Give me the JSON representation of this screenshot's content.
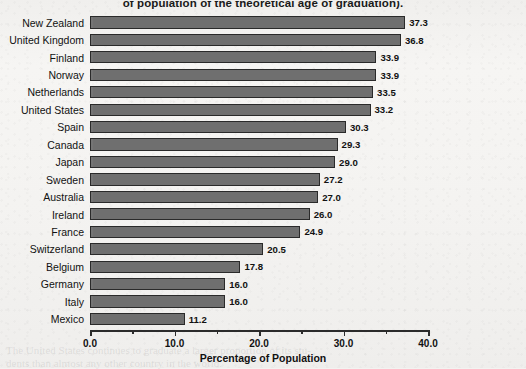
{
  "chart_data": {
    "type": "bar",
    "orientation": "horizontal",
    "title": "of population of the theoretical age of graduation).",
    "xlabel": "Percentage of Population",
    "ylabel": "",
    "xlim": [
      0.0,
      40.0
    ],
    "xticks": [
      "0.0",
      "10.0",
      "20.0",
      "30.0",
      "40.0"
    ],
    "xtick_values": [
      0,
      10,
      20,
      30,
      40
    ],
    "minor_tick_values": [
      5,
      15,
      25,
      35
    ],
    "grid": false,
    "legend": "none",
    "bar_color": "#6f6f6f",
    "bar_edge_color": "#2a2a2a",
    "categories": [
      "New Zealand",
      "United Kingdom",
      "Finland",
      "Norway",
      "Netherlands",
      "United States",
      "Spain",
      "Canada",
      "Japan",
      "Sweden",
      "Australia",
      "Ireland",
      "France",
      "Switzerland",
      "Belgium",
      "Germany",
      "Italy",
      "Mexico"
    ],
    "values": [
      37.3,
      36.8,
      33.9,
      33.9,
      33.5,
      33.2,
      30.3,
      29.3,
      29.0,
      27.2,
      27.0,
      26.0,
      24.9,
      20.5,
      17.8,
      16.0,
      16.0,
      11.2
    ],
    "value_labels": [
      "37.3",
      "36.8",
      "33.9",
      "33.9",
      "33.5",
      "33.2",
      "30.3",
      "29.3",
      "29.0",
      "27.2",
      "27.0",
      "26.0",
      "24.9",
      "20.5",
      "17.8",
      "16.0",
      "16.0",
      "11.2"
    ]
  },
  "bleed_text": {
    "line1": "The United States continues to graduate a larger proportion of its stu-",
    "line2": "dents than almost any other country in the world."
  }
}
